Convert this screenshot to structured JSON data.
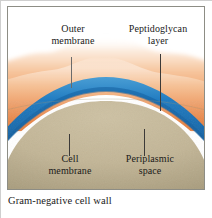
{
  "figure": {
    "caption": "Gram-negative cell wall",
    "labels": [
      {
        "id": "outer-membrane",
        "line1": "Outer",
        "line2": "membrane"
      },
      {
        "id": "peptidoglycan-layer",
        "line1": "Peptidoglycan",
        "line2": "layer"
      },
      {
        "id": "cell-membrane",
        "line1": "Cell",
        "line2": "membrane"
      },
      {
        "id": "periplasmic-space",
        "line1": "Periplasmic",
        "line2": "space"
      }
    ],
    "colors": {
      "outer_membrane_light": "#f7d9bf",
      "outer_membrane_mid": "#f0a574",
      "outer_membrane_dark": "#e5813f",
      "peptidoglycan_blue": "#1f78bd",
      "peptidoglycan_blue_dark": "#1560a0",
      "periplasmic_white": "#ffffff",
      "cell_membrane_tan": "#c2b596",
      "cell_membrane_tan_dark": "#a89c7e",
      "frame": "#8d8d85",
      "text": "#1a1a1a",
      "leader": "#3c3a38"
    }
  }
}
